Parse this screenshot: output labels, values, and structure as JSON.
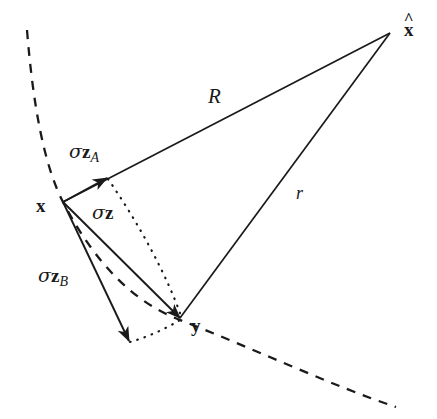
{
  "figure": {
    "background_color": "#ffffff",
    "stroke_color": "#1a1a1a",
    "width": 437,
    "height": 419
  },
  "vertices": [
    {
      "name": "x",
      "label": "x",
      "hat": false,
      "px": 63,
      "py": 202,
      "label_x": 36,
      "label_y": 196
    },
    {
      "name": "y",
      "label": "y",
      "hat": false,
      "px": 180,
      "py": 318,
      "label_x": 191,
      "label_y": 316
    },
    {
      "name": "x-hat",
      "label": "x",
      "hat": true,
      "px": 390,
      "py": 33,
      "label_x": 404,
      "label_y": 20
    }
  ],
  "edge_labels": {
    "R": {
      "text": "R",
      "x": 208,
      "y": 86,
      "description": "distance from x to x-hat"
    },
    "r": {
      "text": "r",
      "x": 296,
      "y": 184,
      "description": "distance from y to x-hat"
    }
  },
  "vector_labels": {
    "sigma_z_A": {
      "sigma": "σ",
      "vec": "z",
      "sub": "A",
      "x": 69,
      "y": 142
    },
    "sigma_z": {
      "sigma": "σ",
      "vec": "z",
      "sub": "",
      "x": 92,
      "y": 203
    },
    "sigma_z_B": {
      "sigma": "σ",
      "vec": "z",
      "sub": "B",
      "x": 38,
      "y": 266
    }
  },
  "arrows": [
    {
      "name": "sigma-z-A-arrow",
      "from": [
        63,
        202
      ],
      "to": [
        107,
        178
      ],
      "style": "solid"
    },
    {
      "name": "sigma-z-arrow",
      "from": [
        63,
        202
      ],
      "to": [
        180,
        318
      ],
      "style": "solid"
    },
    {
      "name": "sigma-z-B-arrow",
      "from": [
        63,
        202
      ],
      "to": [
        129,
        341
      ],
      "style": "solid"
    }
  ],
  "lines": [
    {
      "name": "R-line",
      "from": [
        63,
        202
      ],
      "to": [
        390,
        33
      ],
      "style": "solid",
      "arrow": false
    },
    {
      "name": "r-line",
      "from": [
        180,
        318
      ],
      "to": [
        390,
        33
      ],
      "style": "solid",
      "arrow": false
    }
  ],
  "dotted_paths": [
    {
      "name": "dotted-A-to-y",
      "d": "M 108 179 C 140 225, 168 278, 181 316"
    },
    {
      "name": "dotted-B-to-y",
      "d": "M 130 342 C 148 337, 167 328, 180 320"
    }
  ],
  "dashed_arc": {
    "name": "wavefront-arc",
    "d": "M 27 30 C 33 105, 44 165, 63 202 C 96 265, 135 303, 180 320 C 250 347, 330 385, 396 407",
    "dash": "9 8"
  },
  "legend_notes": {
    "sigma": "σ",
    "z_vector": "z",
    "subscript_A": "A",
    "subscript_B": "B"
  }
}
